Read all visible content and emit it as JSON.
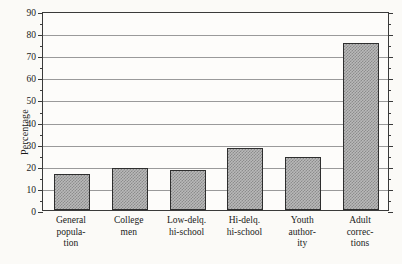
{
  "chart_data": {
    "type": "bar",
    "title": "",
    "xlabel": "",
    "ylabel": "Percentage",
    "ylim": [
      0,
      90
    ],
    "ytick_step": 10,
    "yminor_step": 5,
    "grid": true,
    "legend": false,
    "categories": [
      "General popula- tion",
      "College men",
      "Low-delq. hi-school",
      "Hi-delq. hi-school",
      "Youth author- ity",
      "Adult correc- tions"
    ],
    "category_lines": [
      [
        "General",
        "popula-",
        "tion"
      ],
      [
        "College",
        "men"
      ],
      [
        "Low-delq.",
        "hi-school"
      ],
      [
        "Hi-delq.",
        "hi-school"
      ],
      [
        "Youth",
        "author-",
        "ity"
      ],
      [
        "Adult",
        "correc-",
        "tions"
      ]
    ],
    "values": [
      16.5,
      19,
      18,
      28,
      24,
      75.5
    ],
    "ytick_labels": [
      "0",
      "10",
      "20",
      "30",
      "40",
      "50",
      "60",
      "70",
      "80",
      "90"
    ],
    "ytick_values": [
      0,
      10,
      20,
      30,
      40,
      50,
      60,
      70,
      80,
      90
    ],
    "colors": {
      "bar_fill": "#b9b9b9",
      "bar_hatch": "#8c8c8c",
      "bar_border": "#2e2e2e",
      "gridline": "#9a9a9a",
      "axis": "#3a3a3a",
      "background": "#fbfaf7",
      "plot_background": "#fdfcfa",
      "text": "#1a1a1a"
    }
  }
}
